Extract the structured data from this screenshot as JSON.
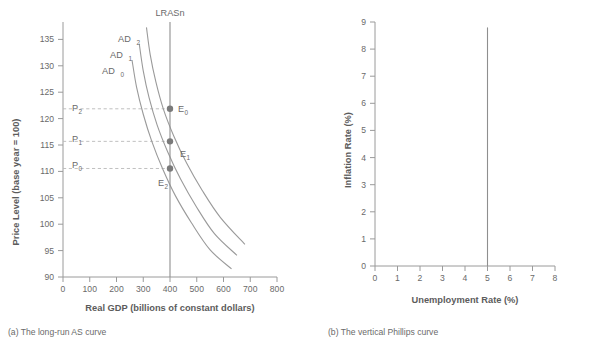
{
  "figure": {
    "panel_a": {
      "caption": "(a) The long-run AS curve",
      "xlabel": "Real GDP (billions of constant dollars)",
      "ylabel": "Price Level (base year = 100)",
      "lras_label": "LRASn",
      "xticks": [
        "0",
        "100",
        "200",
        "300",
        "400",
        "500",
        "600",
        "700",
        "800"
      ],
      "yticks": [
        "90",
        "95",
        "100",
        "105",
        "110",
        "115",
        "120",
        "125",
        "130",
        "135"
      ],
      "ad_labels": [
        {
          "base": "AD",
          "sub": "0"
        },
        {
          "base": "AD",
          "sub": "1"
        },
        {
          "base": "AD",
          "sub": "2"
        }
      ],
      "price_labels": [
        {
          "base": "P",
          "sub": "0"
        },
        {
          "base": "P",
          "sub": "1"
        },
        {
          "base": "P",
          "sub": "2"
        }
      ],
      "equilibrium_labels": [
        {
          "base": "E",
          "sub": "0"
        },
        {
          "base": "E",
          "sub": "1"
        },
        {
          "base": "E",
          "sub": "2"
        }
      ]
    },
    "panel_b": {
      "caption": "(b) The vertical Phillips curve",
      "xlabel": "Unemployment Rate (%)",
      "ylabel": "Inflation Rate (%)",
      "xticks": [
        "0",
        "1",
        "2",
        "3",
        "4",
        "5",
        "6",
        "7",
        "8"
      ],
      "yticks": [
        "0",
        "1",
        "2",
        "3",
        "4",
        "5",
        "6",
        "7",
        "8",
        "9"
      ]
    }
  },
  "colors": {
    "curve": "#9a9a9a",
    "axis": "#9a9a9a",
    "dot": "#7a7a7a",
    "guide": "#b9b9b9",
    "text": "#6a6a6a",
    "background": "#ffffff"
  },
  "chart_data": [
    {
      "type": "line",
      "panel": "a",
      "title": "(a) The long-run AS curve",
      "xlabel": "Real GDP (billions of constant dollars)",
      "ylabel": "Price Level (base year = 100)",
      "xlim": [
        0,
        800
      ],
      "ylim": [
        90,
        137
      ],
      "xticks": [
        0,
        100,
        200,
        300,
        400,
        500,
        600,
        700,
        800
      ],
      "yticks": [
        90,
        95,
        100,
        105,
        110,
        115,
        120,
        125,
        130,
        135
      ],
      "grid": false,
      "legend": "inline-labels",
      "series": [
        {
          "name": "AD0",
          "label": "AD₀",
          "points": [
            [
              258,
              130
            ],
            [
              275,
              125
            ],
            [
              300,
              120
            ],
            [
              332,
              115
            ],
            [
              372,
              110
            ],
            [
              420,
              105
            ],
            [
              480,
              100
            ],
            [
              550,
              95
            ],
            [
              630,
              91.5
            ]
          ]
        },
        {
          "name": "AD1",
          "label": "AD₁",
          "points": [
            [
              285,
              133
            ],
            [
              300,
              128
            ],
            [
              322,
              123
            ],
            [
              352,
              118
            ],
            [
              392,
              113
            ],
            [
              440,
              108
            ],
            [
              498,
              103
            ],
            [
              566,
              98
            ],
            [
              650,
              94
            ]
          ]
        },
        {
          "name": "AD2",
          "label": "AD₂",
          "points": [
            [
              312,
              136
            ],
            [
              326,
              131
            ],
            [
              347,
              126
            ],
            [
              375,
              121
            ],
            [
              414,
              116
            ],
            [
              462,
              111
            ],
            [
              520,
              106
            ],
            [
              588,
              101
            ],
            [
              680,
              96
            ]
          ]
        },
        {
          "name": "LRASn",
          "label": "LRASn",
          "type": "vertical-line",
          "x": 400,
          "y_from": 90,
          "y_to": 137
        }
      ],
      "annotations": [
        {
          "name": "E0",
          "label": "E₀",
          "x": 400,
          "y": 121,
          "marker": "dot",
          "label_pos": "right"
        },
        {
          "name": "E1",
          "label": "E₁",
          "x": 400,
          "y": 115,
          "marker": "dot",
          "label_pos": "below-right"
        },
        {
          "name": "E2",
          "label": "E₂",
          "x": 400,
          "y": 110,
          "marker": "dot",
          "label_pos": "below-left"
        },
        {
          "name": "P2",
          "label": "P₂",
          "y": 121,
          "type": "dashed-guide",
          "from_x": 0,
          "to_x": 400
        },
        {
          "name": "P1",
          "label": "P₁",
          "y": 115,
          "type": "dashed-guide",
          "from_x": 0,
          "to_x": 400
        },
        {
          "name": "P0",
          "label": "P₀",
          "y": 110,
          "type": "dashed-guide",
          "from_x": 0,
          "to_x": 400
        }
      ]
    },
    {
      "type": "line",
      "panel": "b",
      "title": "(b) The vertical Phillips curve",
      "xlabel": "Unemployment Rate (%)",
      "ylabel": "Inflation Rate (%)",
      "xlim": [
        0,
        8
      ],
      "ylim": [
        0,
        9
      ],
      "xticks": [
        0,
        1,
        2,
        3,
        4,
        5,
        6,
        7,
        8
      ],
      "yticks": [
        0,
        1,
        2,
        3,
        4,
        5,
        6,
        7,
        8,
        9
      ],
      "grid": false,
      "legend": "none",
      "series": [
        {
          "name": "vertical-phillips-curve",
          "type": "vertical-line",
          "x": 5,
          "y_from": 0,
          "y_to": 8.8
        }
      ]
    }
  ]
}
